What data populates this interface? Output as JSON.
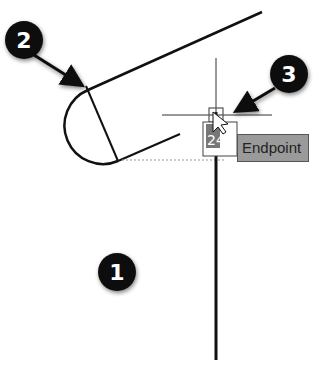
{
  "callouts": [
    {
      "id": 1,
      "label": "1"
    },
    {
      "id": 2,
      "label": "2"
    },
    {
      "id": 3,
      "label": "3"
    }
  ],
  "tooltip": {
    "text": "Endpoint"
  },
  "snap_marker": {
    "glyph_text": "24",
    "glyph_sup": "AB"
  },
  "colors": {
    "line": "#111111",
    "callout": "#111111",
    "tooltip_bg": "#9a9a9a",
    "snap_box": "#555555"
  }
}
